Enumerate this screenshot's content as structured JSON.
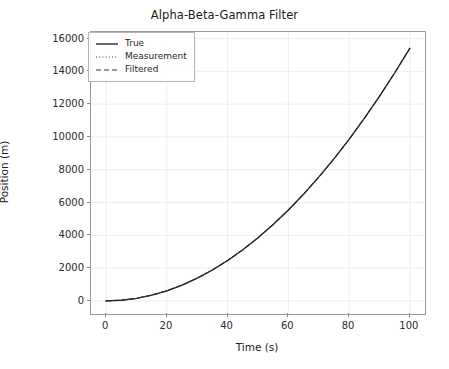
{
  "figure": {
    "width": 449,
    "height": 369,
    "background": "#ffffff"
  },
  "chart_data": {
    "type": "line",
    "title": "Alpha-Beta-Gamma Filter",
    "xlabel": "Time (s)",
    "ylabel": "Position (m)",
    "xlim": [
      -5,
      105
    ],
    "ylim": [
      -800,
      16400
    ],
    "xticks": [
      0,
      20,
      40,
      60,
      80,
      100
    ],
    "xticklabels": [
      "0",
      "20",
      "40",
      "60",
      "80",
      "100"
    ],
    "yticks": [
      0,
      2000,
      4000,
      6000,
      8000,
      10000,
      12000,
      14000,
      16000
    ],
    "yticklabels": [
      "0",
      "2000",
      "4000",
      "6000",
      "8000",
      "10000",
      "12000",
      "14000",
      "16000"
    ],
    "grid": true,
    "grid_color": "#eeeeee",
    "legend_position": "upper left",
    "legend": [
      "True",
      "Measurement",
      "Filtered"
    ],
    "x": [
      0,
      5,
      10,
      15,
      20,
      25,
      30,
      35,
      40,
      45,
      50,
      55,
      60,
      65,
      70,
      75,
      80,
      85,
      90,
      95,
      100
    ],
    "series": [
      {
        "name": "True",
        "linestyle": "solid",
        "color": "#1a1a1a",
        "linewidth": 1.3,
        "values": [
          0,
          39,
          154,
          347,
          616,
          963,
          1386,
          1887,
          2464,
          3119,
          3850,
          4659,
          5544,
          6507,
          7546,
          8663,
          9856,
          11127,
          12474,
          13899,
          15400
        ]
      },
      {
        "name": "Measurement",
        "linestyle": "dotted",
        "color": "#3d3d3d",
        "linewidth": 1.0,
        "values": [
          0,
          39,
          154,
          347,
          616,
          963,
          1386,
          1887,
          2464,
          3119,
          3850,
          4659,
          5544,
          6507,
          7546,
          8663,
          9856,
          11127,
          12474,
          13899,
          15400
        ]
      },
      {
        "name": "Filtered",
        "linestyle": "dashed",
        "color": "#2a2a2a",
        "linewidth": 1.1,
        "values": [
          0,
          39,
          154,
          347,
          616,
          963,
          1386,
          1887,
          2464,
          3119,
          3850,
          4659,
          5544,
          6507,
          7546,
          8663,
          9856,
          11127,
          12474,
          13899,
          15400
        ]
      }
    ],
    "annotations": []
  }
}
